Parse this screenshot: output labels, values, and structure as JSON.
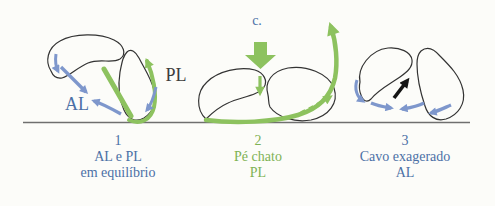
{
  "figure": {
    "description_hint": "Foot arch biomechanics diagram with three foot panels on a ground line",
    "top_label": "c.",
    "colors": {
      "blue_text": "#4b70a6",
      "blue_arrow": "#7e97cc",
      "green_arrow": "#8dc25f",
      "green_text": "#7eb254",
      "bone_outline": "#333333",
      "ground_line": "#6f6f6f",
      "black_arrow": "#141414",
      "pl_label_dark": "#3d3d3d",
      "background": "#fcfcf9"
    },
    "panels": [
      {
        "number": "1",
        "caption_line1": "AL e PL",
        "caption_line2": "em equilíbrio",
        "caption_color": "#4b70a6",
        "label_al": "AL",
        "label_pl": "PL"
      },
      {
        "number": "2",
        "caption_line1": "Pé chato",
        "caption_line2": "PL",
        "caption_color": "#7eb254"
      },
      {
        "number": "3",
        "caption_line1": "Cavo exagerado",
        "caption_line2": "AL",
        "caption_color": "#4b70a6"
      }
    ]
  }
}
